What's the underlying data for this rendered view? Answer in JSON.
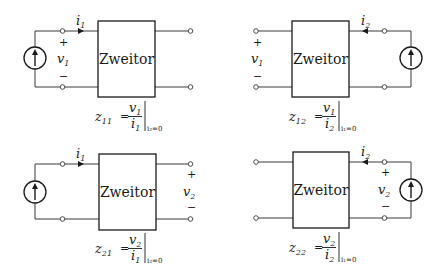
{
  "figure": {
    "colors": {
      "line": "#1a1a1a",
      "background": "#ffffff"
    },
    "panels": [
      {
        "id": "z11",
        "box_label": "Zweitor",
        "current_label": "i",
        "current_sub": "1",
        "voltage_label": "v",
        "voltage_sub": "1",
        "plus": "+",
        "minus": "−",
        "source_side": "left",
        "formula": {
          "lhs": "z",
          "lhs_sub": "11",
          "eq": "=",
          "num": "v",
          "num_sub": "1",
          "den": "i",
          "den_sub": "1",
          "cond": "i₂=0"
        }
      },
      {
        "id": "z12",
        "box_label": "Zweitor",
        "current_label": "i",
        "current_sub": "2",
        "voltage_label": "v",
        "voltage_sub": "1",
        "plus": "+",
        "minus": "−",
        "source_side": "right",
        "formula": {
          "lhs": "z",
          "lhs_sub": "12",
          "eq": "=",
          "num": "v",
          "num_sub": "1",
          "den": "i",
          "den_sub": "2",
          "cond": "i₁=0"
        }
      },
      {
        "id": "z21",
        "box_label": "Zweitor",
        "current_label": "i",
        "current_sub": "1",
        "voltage_label": "v",
        "voltage_sub": "2",
        "plus": "+",
        "minus": "−",
        "source_side": "left",
        "formula": {
          "lhs": "z",
          "lhs_sub": "21",
          "eq": "=",
          "num": "v",
          "num_sub": "2",
          "den": "i",
          "den_sub": "1",
          "cond": "i₂=0"
        }
      },
      {
        "id": "z22",
        "box_label": "Zweitor",
        "current_label": "i",
        "current_sub": "2",
        "voltage_label": "v",
        "voltage_sub": "2",
        "plus": "+",
        "minus": "−",
        "source_side": "right",
        "formula": {
          "lhs": "z",
          "lhs_sub": "22",
          "eq": "=",
          "num": "v",
          "num_sub": "2",
          "den": "i",
          "den_sub": "2",
          "cond": "i₁=0"
        }
      }
    ]
  }
}
